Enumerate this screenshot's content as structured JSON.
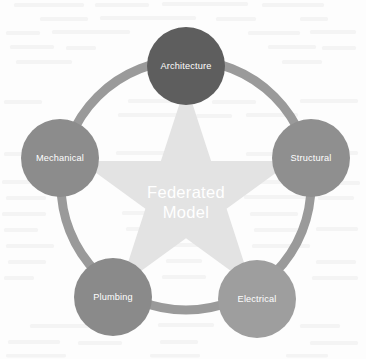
{
  "diagram": {
    "type": "radial-hub-and-spoke",
    "title": "Federated Model",
    "center": {
      "label_line1": "Federated",
      "label_line2": "Model",
      "shape": "five-pointed-star",
      "shape_color": "#e3e3e3",
      "text_color": "#ffffff"
    },
    "ring": {
      "color": "#9a9a9a",
      "stroke_width": 9,
      "radius": 125
    },
    "nodes": [
      {
        "id": "architecture",
        "label": "Architecture",
        "color": "#5e5e5e",
        "text_color": "#ffffff",
        "cx": 186,
        "cy": 66,
        "r": 39,
        "position": "top"
      },
      {
        "id": "structural",
        "label": "Structural",
        "color": "#8f8f8f",
        "text_color": "#ffffff",
        "cx": 311,
        "cy": 158,
        "r": 39,
        "position": "right"
      },
      {
        "id": "electrical",
        "label": "Electrical",
        "color": "#9e9e9e",
        "text_color": "#ffffff",
        "cx": 257,
        "cy": 299,
        "r": 39,
        "position": "bottom-right"
      },
      {
        "id": "plumbing",
        "label": "Plumbing",
        "color": "#8a8a8a",
        "text_color": "#ffffff",
        "cx": 113,
        "cy": 297,
        "r": 39,
        "position": "bottom-left"
      },
      {
        "id": "mechanical",
        "label": "Mechanical",
        "color": "#8c8c8c",
        "text_color": "#ffffff",
        "cx": 60,
        "cy": 158,
        "r": 39,
        "position": "left"
      }
    ]
  }
}
